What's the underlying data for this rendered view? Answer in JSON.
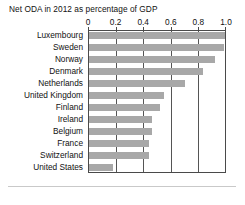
{
  "chart_data": {
    "type": "bar",
    "orientation": "horizontal",
    "title": "Net ODA in 2012 as percentage of GDP",
    "xlabel": "",
    "ylabel": "",
    "xlim": [
      0,
      1.0
    ],
    "xticks": [
      "0",
      "0.2",
      "0.4",
      "0.6",
      "0.8",
      "1.0"
    ],
    "xtick_values": [
      0,
      0.2,
      0.4,
      0.6,
      0.8,
      1.0
    ],
    "grid": true,
    "legend": "none",
    "categories": [
      "Luxembourg",
      "Sweden",
      "Norway",
      "Denmark",
      "Netherlands",
      "United Kingdom",
      "Finland",
      "Ireland",
      "Belgium",
      "France",
      "Switzerland",
      "United States"
    ],
    "values": [
      1.0,
      0.99,
      0.93,
      0.84,
      0.71,
      0.56,
      0.53,
      0.47,
      0.47,
      0.45,
      0.45,
      0.19
    ],
    "bar_color": "#a8a8a8",
    "axis_color": "#4a4a4a",
    "background_color": "#ffffff"
  }
}
